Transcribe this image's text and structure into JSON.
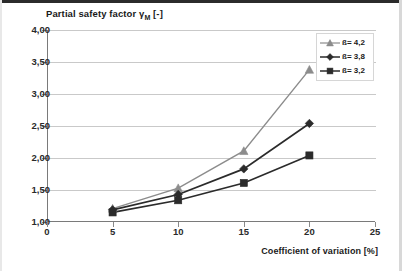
{
  "chart_data": {
    "type": "line",
    "title": "Partial safety factor γM [-]",
    "title_main": "Partial safety factor ",
    "title_gamma": "γ",
    "title_sub": "M",
    "title_tail": " [-]",
    "xlabel": "Coefficient of variation [%]",
    "ylabel": "",
    "x": [
      5,
      10,
      15,
      20
    ],
    "xlim": [
      0,
      25
    ],
    "ylim": [
      1.0,
      4.0
    ],
    "xticks": [
      "0",
      "5",
      "10",
      "15",
      "20",
      "25"
    ],
    "xtick_values": [
      0,
      5,
      10,
      15,
      20,
      25
    ],
    "yticks": [
      "1,00",
      "1,50",
      "2,00",
      "2,50",
      "3,00",
      "3,50",
      "4,00"
    ],
    "ytick_values": [
      1.0,
      1.5,
      2.0,
      2.5,
      3.0,
      3.5,
      4.0
    ],
    "grid": true,
    "legend_position": "top-right",
    "series": [
      {
        "name": "ß= 4,2",
        "marker": "triangle",
        "color": "#8c8c8c",
        "values": [
          1.21,
          1.53,
          2.11,
          3.38
        ]
      },
      {
        "name": "ß= 3,8",
        "marker": "diamond",
        "color": "#2b2b2b",
        "values": [
          1.19,
          1.43,
          1.83,
          2.54
        ]
      },
      {
        "name": "ß= 3,2",
        "marker": "square",
        "color": "#2b2b2b",
        "values": [
          1.15,
          1.34,
          1.61,
          2.04
        ]
      }
    ]
  },
  "legend": {
    "items": [
      {
        "label": "ß= 4,2"
      },
      {
        "label": "ß= 3,8"
      },
      {
        "label": "ß= 3,2"
      }
    ]
  }
}
